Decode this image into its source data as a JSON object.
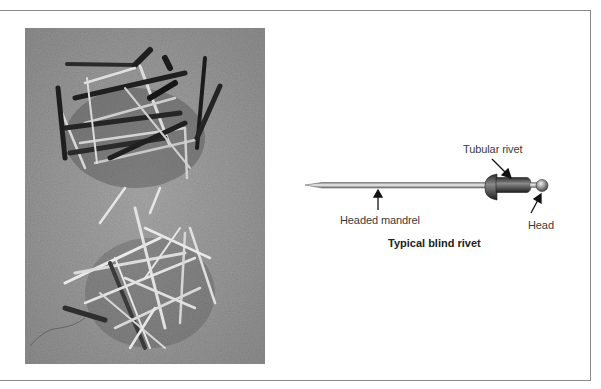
{
  "figure": {
    "photo": {
      "description": "Black-and-white photo of two piles of blind rivets (dark and bright) on concrete"
    },
    "diagram": {
      "labels": {
        "tubular_rivet": "Tubular rivet",
        "headed_mandrel": "Headed mandrel",
        "head": "Head"
      },
      "caption": "Typical blind rivet"
    },
    "colors": {
      "frame": "#8a8a8a",
      "photo_bg": "#9a9a9a",
      "label_text": "#3a3a3a"
    }
  }
}
